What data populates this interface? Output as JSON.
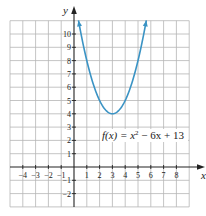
{
  "chart_data": {
    "type": "line",
    "title": "",
    "xlabel": "x",
    "ylabel": "y",
    "xlim": [
      -5,
      9
    ],
    "ylim": [
      -3,
      11
    ],
    "grid": true,
    "x_ticks": [
      -4,
      -3,
      -2,
      -1,
      1,
      2,
      3,
      4,
      5,
      6,
      7,
      8
    ],
    "x_tick_labels": [
      "−4",
      "−3",
      "−2",
      "−1",
      "1",
      "2",
      "3",
      "4",
      "5",
      "6",
      "7",
      "8"
    ],
    "y_ticks": [
      10,
      9,
      8,
      7,
      6,
      5,
      4,
      3,
      2,
      1,
      -1,
      -2
    ],
    "y_tick_labels": [
      "10",
      "9",
      "8",
      "7",
      "6",
      "5",
      "4",
      "3",
      "2",
      "1",
      "−1",
      "−2"
    ],
    "series": [
      {
        "name": "f(x) = x² − 6x + 13",
        "function": "x^2 - 6x + 13",
        "x_range": [
          0.35,
          5.65
        ],
        "vertex": [
          3,
          4
        ],
        "color": "#3a93c4",
        "arrows": "both-ends"
      }
    ],
    "annotations": [
      {
        "text_main": "f(x) = x",
        "superscript": "2",
        "text_rest": " − 6x + 13",
        "near": [
          5,
          2.5
        ]
      }
    ]
  }
}
